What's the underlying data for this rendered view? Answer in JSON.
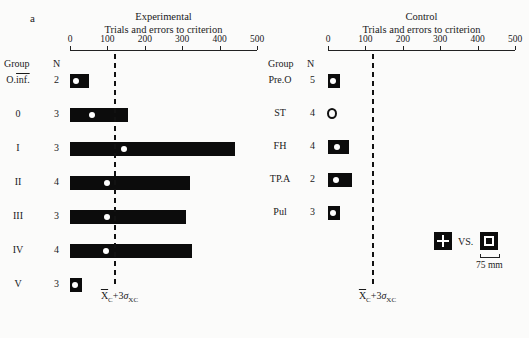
{
  "panel_label": "a",
  "chart_data": [
    {
      "type": "bar",
      "orientation": "horizontal",
      "title": "Experimental",
      "xlabel": "Trials and errors to criterion",
      "xlim": [
        0,
        500
      ],
      "xticks": [
        0,
        100,
        200,
        300,
        400,
        500
      ],
      "column_headers": {
        "group": "Group",
        "n": "N"
      },
      "categories": [
        "O.inf.",
        "0",
        "I",
        "II",
        "III",
        "IV",
        "V"
      ],
      "n": [
        2,
        3,
        3,
        4,
        3,
        4,
        3
      ],
      "series": [
        {
          "name": "range_max",
          "values": [
            50,
            155,
            440,
            320,
            310,
            325,
            20
          ]
        },
        {
          "name": "mean",
          "values": [
            15,
            60,
            145,
            100,
            100,
            95,
            12
          ]
        }
      ],
      "criterion_line": {
        "value": 120,
        "label_base": "X",
        "label_sub1": "C",
        "label_mid": "+3",
        "label_sigma": "σ",
        "label_sub2": "XC"
      },
      "grid": false
    },
    {
      "type": "bar",
      "orientation": "horizontal",
      "title": "Control",
      "xlabel": "Trials and errors to criterion",
      "xlim": [
        0,
        500
      ],
      "xticks": [
        0,
        100,
        200,
        300,
        400,
        500
      ],
      "column_headers": {
        "group": "Group",
        "n": "N"
      },
      "categories": [
        "Pre.O",
        "ST",
        "FH",
        "TP.A",
        "Pul"
      ],
      "n": [
        5,
        4,
        4,
        2,
        3
      ],
      "series": [
        {
          "name": "range_max",
          "values": [
            25,
            10,
            55,
            65,
            22
          ]
        },
        {
          "name": "mean",
          "values": [
            12,
            5,
            25,
            22,
            10
          ]
        }
      ],
      "criterion_line": {
        "value": 120,
        "label_base": "X",
        "label_sub1": "C",
        "label_mid": "+3",
        "label_sigma": "σ",
        "label_sub2": "XC"
      },
      "grid": false
    }
  ],
  "stimulus": {
    "vs_label": "VS.",
    "scale_label": "75 mm"
  }
}
